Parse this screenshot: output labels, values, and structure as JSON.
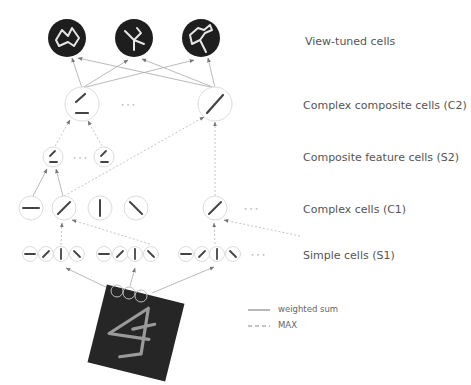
{
  "layers": [
    {
      "id": "view_tuned",
      "label": "View-tuned cells",
      "label_y": 43
    },
    {
      "id": "c2",
      "label": "Complex composite cells (C2)",
      "label_y": 108
    },
    {
      "id": "s2",
      "label": "Composite feature cells (S2)",
      "label_y": 160
    },
    {
      "id": "c1",
      "label": "Complex cells (C1)",
      "label_y": 212
    },
    {
      "id": "s1",
      "label": "Simple cells (S1)",
      "label_y": 258
    }
  ],
  "legend": {
    "weighted_sum": "weighted sum",
    "max": "MAX"
  },
  "ellipsis": "• • •",
  "colors": {
    "dark_cell": "#1e1e1e",
    "cell_outline": "#dddddd",
    "bar": "#444444",
    "arrow": "#999999",
    "label": "#555555",
    "input_bg": "#222222",
    "stroke_light": "#c9c9c9"
  },
  "view_tuned_cells": [
    {
      "x": 67,
      "y": 38,
      "shape": "zigzag"
    },
    {
      "x": 134,
      "y": 38,
      "shape": "y-junction"
    },
    {
      "x": 201,
      "y": 38,
      "shape": "closed-contour"
    }
  ],
  "c2_cells": [
    {
      "x": 82,
      "y": 104,
      "bars": [
        "diagonal",
        "horizontal"
      ]
    },
    {
      "x": 215,
      "y": 104,
      "bars": [
        "diagonal-long"
      ]
    }
  ],
  "s2_cells": [
    {
      "x": 53,
      "y": 157
    },
    {
      "x": 104,
      "y": 157
    }
  ],
  "c1_cells": [
    {
      "x": 31,
      "y": 208,
      "orientation": "horizontal"
    },
    {
      "x": 64,
      "y": 208,
      "orientation": "diagonal"
    },
    {
      "x": 100,
      "y": 208,
      "orientation": "vertical"
    },
    {
      "x": 136,
      "y": 208,
      "orientation": "anti-diagonal"
    },
    {
      "x": 215,
      "y": 208,
      "orientation": "diagonal"
    }
  ],
  "s1_cells": [
    {
      "x": 30,
      "o": "horizontal"
    },
    {
      "x": 46,
      "o": "diagonal"
    },
    {
      "x": 61,
      "o": "vertical"
    },
    {
      "x": 77,
      "o": "anti-diagonal"
    },
    {
      "x": 104,
      "o": "horizontal"
    },
    {
      "x": 120,
      "o": "diagonal"
    },
    {
      "x": 135,
      "o": "vertical"
    },
    {
      "x": 151,
      "o": "anti-diagonal"
    },
    {
      "x": 186,
      "o": "horizontal"
    },
    {
      "x": 202,
      "o": "diagonal"
    },
    {
      "x": 217,
      "o": "vertical"
    },
    {
      "x": 233,
      "o": "anti-diagonal"
    }
  ],
  "input_image": {
    "cx": 136,
    "cy": 333,
    "size": 80,
    "rotation_deg": 14,
    "description": "handwritten-like paperclip shape on dark patch"
  }
}
